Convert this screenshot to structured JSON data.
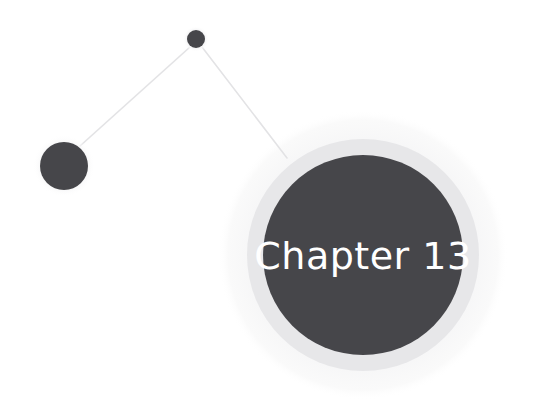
{
  "page": {
    "width": 535,
    "height": 418,
    "background_color": "#ffffff",
    "kind": "chapter-divider-graphic"
  },
  "graphic": {
    "title_text": "Chapter 13",
    "title_color": "#ffffff",
    "title_font_size_px": 38,
    "title_x": 363,
    "title_y": 258,
    "colors": {
      "dark_fill": "#46464a",
      "mid_ring": "#e7e7e9",
      "outer_ring": "#f7f7f8",
      "halo": "#f2f2f3",
      "connector_line": "#e3e3e5",
      "background": "#ffffff"
    },
    "nodes": [
      {
        "name": "large-node",
        "label": "Chapter 13",
        "cx": 363,
        "cy": 255,
        "r": 100,
        "mid_ring_r": 116,
        "outer_ring_r": 145,
        "fill": "#46464a"
      },
      {
        "name": "medium-node",
        "label": "",
        "cx": 64,
        "cy": 166,
        "r": 24,
        "halo_r": 31,
        "fill": "#46464a"
      },
      {
        "name": "small-node",
        "label": "",
        "cx": 196,
        "cy": 39,
        "r": 9,
        "halo_r": 13,
        "fill": "#46464a"
      }
    ],
    "connectors": [
      {
        "name": "connector-small-to-medium",
        "x1": 190,
        "y1": 47,
        "x2": 80,
        "y2": 146,
        "stroke": "#e3e3e5",
        "stroke_width": 1.6
      },
      {
        "name": "connector-small-to-large",
        "x1": 202,
        "y1": 47,
        "x2": 287,
        "y2": 158,
        "stroke": "#e3e3e5",
        "stroke_width": 1.6
      }
    ]
  }
}
